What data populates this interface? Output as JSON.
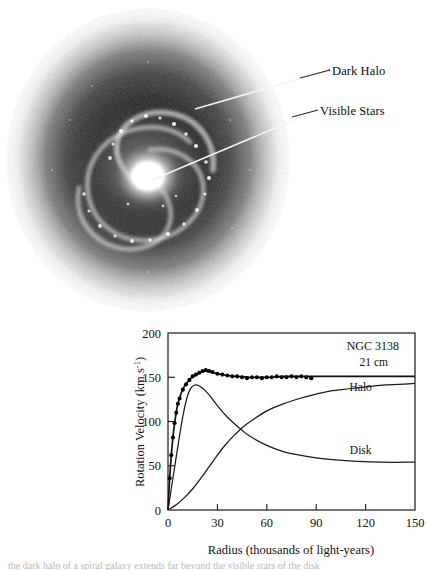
{
  "figure": {
    "panels": {
      "photo": {
        "alt_name": "spiral-galaxy-with-dark-halo",
        "labels": [
          {
            "id": "dark-halo",
            "text": "Dark Halo"
          },
          {
            "id": "visible-stars",
            "text": "Visible Stars"
          }
        ]
      }
    },
    "caption_partial": "the dark halo of a spiral galaxy extends far beyond the visible stars of the disk"
  },
  "chart_data": {
    "type": "line",
    "title": "NGC 3138",
    "xlabel": "Radius (thousands of light-years)",
    "ylabel": "Rotation Velocity (km s",
    "ylabel_exponent": "-1",
    "ylabel_suffix": ")",
    "xlim": [
      0,
      150
    ],
    "ylim": [
      0,
      200
    ],
    "xticks": [
      0,
      30,
      60,
      90,
      120,
      150
    ],
    "yticks": [
      0,
      50,
      100,
      150,
      200
    ],
    "grid": false,
    "legend_position": "inline-curve-labels",
    "series": [
      {
        "name": "21 cm",
        "label": "21 cm",
        "kind": "line-with-markers",
        "label_x": 125,
        "label_y": 163,
        "x": [
          0,
          1,
          2,
          3,
          4,
          5,
          6,
          8,
          10,
          12,
          14,
          16,
          18,
          20,
          23,
          26,
          30,
          36,
          42,
          48,
          55,
          62,
          70,
          80,
          90,
          100,
          115,
          130,
          150
        ],
        "y": [
          0,
          35,
          62,
          82,
          98,
          110,
          120,
          132,
          140,
          145,
          149,
          152,
          154,
          156,
          157,
          156,
          154,
          152,
          151,
          150,
          150,
          150,
          151,
          151,
          151,
          151,
          151,
          151,
          151
        ]
      },
      {
        "name": "Halo",
        "label": "Halo",
        "kind": "line",
        "label_x": 117,
        "label_y": 134,
        "x": [
          0,
          5,
          10,
          15,
          20,
          25,
          30,
          35,
          40,
          45,
          50,
          60,
          70,
          80,
          90,
          100,
          110,
          120,
          130,
          140,
          150
        ],
        "y": [
          0,
          6,
          14,
          24,
          36,
          49,
          62,
          74,
          84,
          93,
          100,
          112,
          120,
          126,
          131,
          135,
          137,
          139,
          141,
          142,
          143
        ]
      },
      {
        "name": "Disk",
        "label": "Disk",
        "kind": "line",
        "label_x": 117,
        "label_y": 63,
        "x": [
          0,
          2,
          4,
          6,
          8,
          10,
          12,
          14,
          16,
          18,
          20,
          22,
          25,
          30,
          35,
          40,
          45,
          50,
          60,
          70,
          80,
          90,
          100,
          115,
          130,
          150
        ],
        "y": [
          0,
          24,
          48,
          72,
          95,
          115,
          130,
          138,
          141,
          141,
          139,
          136,
          130,
          118,
          107,
          98,
          90,
          83,
          73,
          66,
          62,
          59,
          57,
          55,
          54,
          54
        ]
      }
    ],
    "markers": {
      "series": "21 cm",
      "x": [
        1,
        2,
        3,
        4,
        5,
        6,
        7,
        9,
        11,
        13,
        15,
        17,
        19,
        21,
        23,
        25,
        27,
        30,
        33,
        36,
        39,
        42,
        45,
        48,
        51,
        54,
        57,
        60,
        63,
        66,
        69,
        72,
        75,
        78,
        81,
        84,
        87
      ],
      "y": [
        36,
        62,
        82,
        98,
        110,
        120,
        126,
        136,
        142,
        147,
        151,
        153,
        155,
        157,
        158,
        157,
        156,
        154,
        153,
        152,
        151,
        151,
        150,
        149,
        150,
        150,
        149,
        150,
        150,
        151,
        150,
        150,
        151,
        150,
        151,
        150,
        149
      ]
    }
  }
}
